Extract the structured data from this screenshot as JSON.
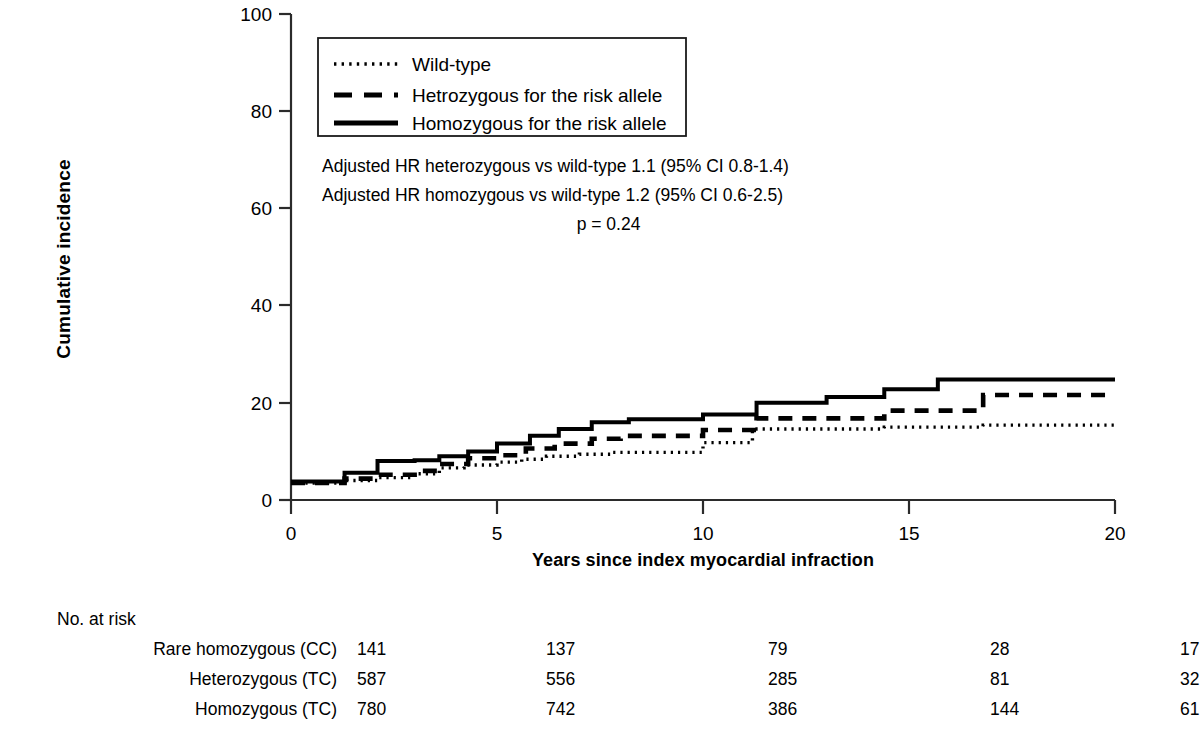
{
  "chart_data": {
    "type": "line",
    "title": "",
    "xlabel": "Years since index myocardial infraction",
    "ylabel": "Cumulative incidence",
    "xlim": [
      0,
      20
    ],
    "ylim": [
      0,
      100
    ],
    "xticks": [
      0,
      5,
      10,
      15,
      20
    ],
    "yticks": [
      0,
      20,
      40,
      60,
      80,
      100
    ],
    "grid": false,
    "legend_position": "upper-left-inside",
    "step_type": "post",
    "series": [
      {
        "name": "Wild-type",
        "style": "dotted",
        "x": [
          0,
          1.3,
          2.1,
          3.0,
          3.6,
          4.2,
          5.0,
          5.6,
          6.2,
          7.0,
          7.8,
          10.0,
          11.2,
          14.4,
          16.8,
          20
        ],
        "values": [
          3.5,
          4.0,
          4.6,
          5.4,
          6.6,
          7.2,
          7.8,
          8.4,
          9.0,
          9.4,
          9.8,
          11.8,
          14.6,
          15.0,
          15.4,
          15.4
        ]
      },
      {
        "name": "Hetrozygous for the risk allele",
        "style": "dashed",
        "x": [
          0,
          1.3,
          2.1,
          3.0,
          3.6,
          4.3,
          5.0,
          5.7,
          6.4,
          7.3,
          8.0,
          10.0,
          11.3,
          14.4,
          16.8,
          20
        ],
        "values": [
          3.5,
          4.4,
          5.2,
          6.0,
          7.4,
          8.6,
          9.2,
          10.6,
          11.6,
          12.6,
          13.2,
          14.4,
          16.8,
          18.4,
          21.6,
          21.6
        ]
      },
      {
        "name": "Homozygous for the risk allele",
        "style": "solid",
        "x": [
          0,
          1.3,
          2.1,
          3.0,
          3.6,
          4.3,
          5.0,
          5.8,
          6.5,
          7.3,
          8.2,
          10.0,
          11.3,
          13.0,
          14.4,
          15.7,
          20
        ],
        "values": [
          3.8,
          5.6,
          8.0,
          8.2,
          9.0,
          10.0,
          11.6,
          13.2,
          14.6,
          16.0,
          16.6,
          17.6,
          20.0,
          21.2,
          22.8,
          24.8,
          24.8
        ]
      }
    ],
    "annotations": [
      "Adjusted HR heterozygous vs wild-type 1.1 (95% CI 0.8-1.4)",
      "Adjusted HR homozygous vs wild-type 1.2 (95% CI 0.6-2.5)",
      "p = 0.24"
    ]
  },
  "legend": {
    "items": [
      {
        "label": "Wild-type",
        "style": "dotted"
      },
      {
        "label": "Hetrozygous for the risk allele",
        "style": "dashed"
      },
      {
        "label": "Homozygous for the risk allele",
        "style": "solid"
      }
    ]
  },
  "axes": {
    "y_title": "Cumulative incidence",
    "x_title": "Years since index myocardial infraction",
    "y_ticks": [
      "0",
      "20",
      "40",
      "60",
      "80",
      "100"
    ],
    "x_ticks": [
      "0",
      "5",
      "10",
      "15",
      "20"
    ]
  },
  "risk_table": {
    "heading": "No. at risk",
    "rows": [
      {
        "label": "Rare homozygous (CC)",
        "values": [
          "141",
          "137",
          "79",
          "28",
          "17"
        ]
      },
      {
        "label": "Heterozygous (TC)",
        "values": [
          "587",
          "556",
          "285",
          "81",
          "32"
        ]
      },
      {
        "label": "Homozygous (TC)",
        "values": [
          "780",
          "742",
          "386",
          "144",
          "61"
        ]
      }
    ]
  },
  "colors": {
    "ink": "#000000",
    "background": "#ffffff",
    "axis": "#333333"
  }
}
